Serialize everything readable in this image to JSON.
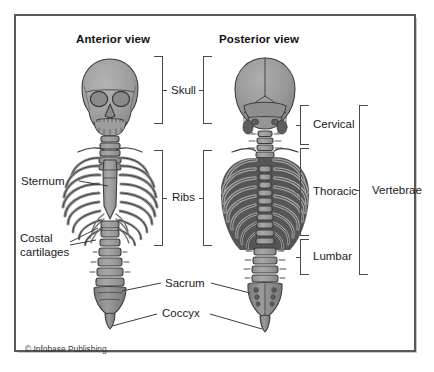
{
  "figure": {
    "credit": "© Infobase Publishing",
    "border_color": "#58585a",
    "bone_fill": "#9a9a9a",
    "bone_outline": "#3c3c3e",
    "background": "#ffffff"
  },
  "views": {
    "anterior_title": "Anterior view",
    "posterior_title": "Posterior view"
  },
  "brackets": [
    {
      "id": "skull-anterior",
      "label": "Skull",
      "side": "right-facing"
    },
    {
      "id": "skull-posterior",
      "label": "Skull",
      "side": "left-facing"
    },
    {
      "id": "ribs-anterior",
      "label": "Ribs",
      "side": "right-facing"
    },
    {
      "id": "ribs-posterior",
      "label": "Ribs",
      "side": "left-facing"
    },
    {
      "id": "cervical",
      "label": "Cervical",
      "side": "left-facing"
    },
    {
      "id": "thoracic",
      "label": "Thoracic",
      "side": "left-facing"
    },
    {
      "id": "lumbar",
      "label": "Lumbar",
      "side": "left-facing"
    },
    {
      "id": "vertebrae",
      "label": "Vertebrae",
      "side": "left-facing"
    }
  ],
  "bracket_labels": {
    "skull": "Skull",
    "ribs": "Ribs",
    "cervical": "Cervical",
    "thoracic": "Thoracic",
    "lumbar": "Lumbar",
    "vertebrae": "Vertebrae"
  },
  "callouts": {
    "sternum": "Sternum",
    "costal_line1": "Costal",
    "costal_line2": "cartilages",
    "costal_full": "Costal cartilages",
    "sacrum": "Sacrum",
    "coccyx": "Coccyx"
  }
}
